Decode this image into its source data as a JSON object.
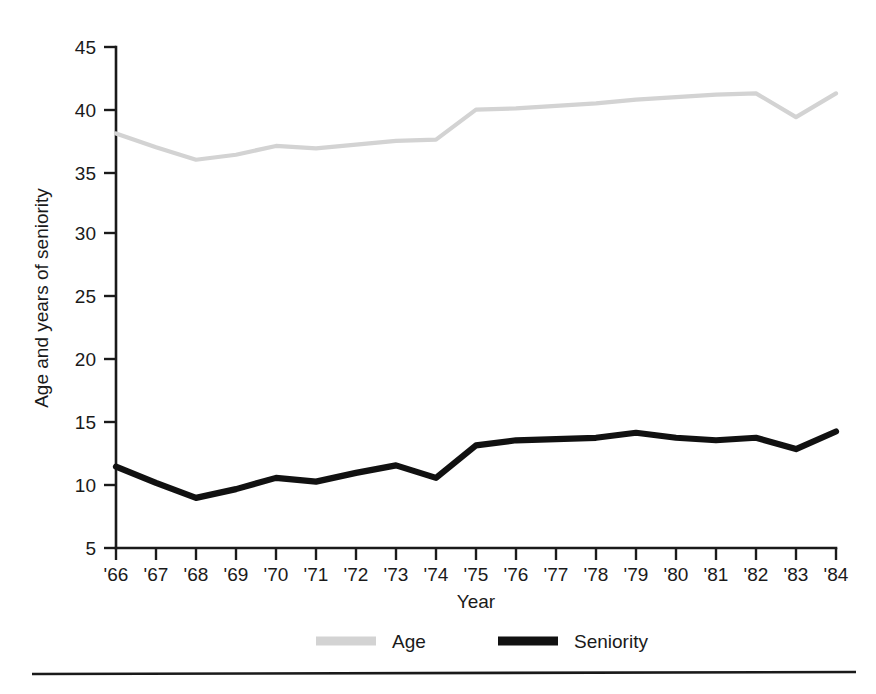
{
  "chart_data": {
    "type": "line",
    "title": "",
    "xlabel": "Year",
    "ylabel": "Age and years of seniority",
    "x": [
      1966,
      1967,
      1968,
      1969,
      1970,
      1971,
      1972,
      1973,
      1974,
      1975,
      1976,
      1977,
      1978,
      1979,
      1980,
      1981,
      1982,
      1983,
      1984
    ],
    "categories": [
      "'66",
      "'67",
      "'68",
      "'69",
      "'70",
      "'71",
      "'72",
      "'73",
      "'74",
      "'75",
      "'76",
      "'77",
      "'78",
      "'79",
      "'80",
      "'81",
      "'82",
      "'83",
      "'84"
    ],
    "xlim": [
      1966,
      1984
    ],
    "ylim": [
      5,
      45
    ],
    "yticks": [
      5,
      10,
      15,
      20,
      25,
      30,
      35,
      40,
      45
    ],
    "ytick_labels": [
      "5",
      "10",
      "15",
      "20",
      "25",
      "30",
      "35",
      "40",
      "45"
    ],
    "grid": false,
    "legend_position": "below-axis",
    "series": [
      {
        "name": "Age",
        "color": "#d3d3d3",
        "style": "light-gray-thin",
        "values": [
          38.1,
          37.0,
          36.0,
          36.4,
          37.1,
          36.9,
          37.2,
          37.5,
          37.6,
          40.0,
          40.1,
          40.3,
          40.5,
          40.8,
          41.0,
          41.2,
          41.3,
          39.4,
          41.3
        ]
      },
      {
        "name": "Seniority",
        "color": "#111111",
        "style": "black-bold",
        "values": [
          11.5,
          10.2,
          9.0,
          9.7,
          10.6,
          10.3,
          11.0,
          11.6,
          10.6,
          13.2,
          13.6,
          13.7,
          13.8,
          14.2,
          13.8,
          13.6,
          13.8,
          12.9,
          14.3
        ]
      }
    ]
  },
  "legend": {
    "items": [
      {
        "label": "Age",
        "color": "#d3d3d3"
      },
      {
        "label": "Seniority",
        "color": "#111111"
      }
    ]
  },
  "axes": {
    "x_title": "Year",
    "y_title": "Age and years of seniority"
  }
}
